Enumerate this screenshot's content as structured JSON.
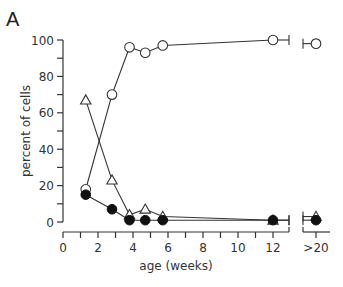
{
  "panel_label": "A",
  "chart_data": {
    "type": "line",
    "title": "",
    "xlabel": "age (weeks)",
    "ylabel": "percent of cells",
    "x_ticks": [
      "0",
      "2",
      "4",
      "6",
      "8",
      "10",
      "12",
      ">20"
    ],
    "y_ticks": [
      "0",
      "20",
      "40",
      "60",
      "80",
      "100"
    ],
    "ylim": [
      0,
      100
    ],
    "xlim": [
      0,
      13
    ],
    "axis_break": "between 12 and >20",
    "grid": false,
    "legend": "none",
    "x": [
      1.3,
      2.8,
      3.8,
      4.7,
      5.7,
      12,
      ">20"
    ],
    "series": [
      {
        "name": "open circles",
        "marker": "open-circle",
        "values": [
          18,
          70,
          96,
          93,
          97,
          100,
          98
        ]
      },
      {
        "name": "open triangles",
        "marker": "open-triangle",
        "values": [
          67,
          23,
          4,
          7,
          3,
          1,
          3
        ]
      },
      {
        "name": "filled circles",
        "marker": "filled-circle",
        "values": [
          15,
          7,
          1,
          1,
          1,
          1,
          1
        ]
      }
    ]
  }
}
